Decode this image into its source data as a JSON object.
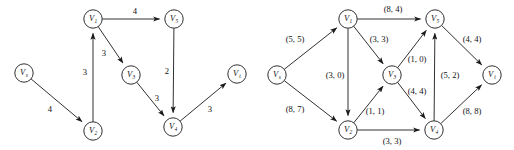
{
  "figure": {
    "background_color": "#ffffff",
    "ink_color": "#1a1a1a",
    "panel_count": 2
  },
  "chart_data": [
    {
      "type": "diagram",
      "subtype": "directed-weighted-graph",
      "name": "left-graph",
      "title": "",
      "edge_label_format": "weight",
      "nodes": [
        {
          "id": "vs",
          "label": "V",
          "subscript": "s",
          "x": 24,
          "y": 73
        },
        {
          "id": "v1",
          "label": "V",
          "subscript": "1",
          "x": 93,
          "y": 19
        },
        {
          "id": "v2",
          "label": "V",
          "subscript": "2",
          "x": 93,
          "y": 131
        },
        {
          "id": "v3",
          "label": "V",
          "subscript": "3",
          "x": 131,
          "y": 75
        },
        {
          "id": "v4",
          "label": "V",
          "subscript": "4",
          "x": 173,
          "y": 127
        },
        {
          "id": "v5",
          "label": "V",
          "subscript": "5",
          "x": 174,
          "y": 19
        },
        {
          "id": "vt",
          "label": "V",
          "subscript": "t",
          "x": 237,
          "y": 74
        }
      ],
      "edges": [
        {
          "from": "vs",
          "to": "v2",
          "label": "4",
          "label_x": 50,
          "label_y": 110
        },
        {
          "from": "v2",
          "to": "v1",
          "label": "3",
          "label_x": 85,
          "label_y": 73
        },
        {
          "from": "v1",
          "to": "v5",
          "label": "4",
          "label_x": 135,
          "label_y": 12
        },
        {
          "from": "v1",
          "to": "v3",
          "label": "3",
          "label_x": 104,
          "label_y": 54
        },
        {
          "from": "v3",
          "to": "v4",
          "label": "3",
          "label_x": 157,
          "label_y": 99
        },
        {
          "from": "v5",
          "to": "v4",
          "label": "2",
          "label_x": 167,
          "label_y": 72
        },
        {
          "from": "v4",
          "to": "vt",
          "label": "3",
          "label_x": 210,
          "label_y": 110
        }
      ]
    },
    {
      "type": "diagram",
      "subtype": "directed-flow-network",
      "name": "right-graph",
      "title": "",
      "edge_label_format": "(capacity, flow)",
      "nodes": [
        {
          "id": "vs",
          "label": "V",
          "subscript": "s",
          "x": 277,
          "y": 75
        },
        {
          "id": "v1",
          "label": "V",
          "subscript": "1",
          "x": 348,
          "y": 19
        },
        {
          "id": "v2",
          "label": "V",
          "subscript": "2",
          "x": 348,
          "y": 130
        },
        {
          "id": "v3",
          "label": "V",
          "subscript": "3",
          "x": 392,
          "y": 75
        },
        {
          "id": "v4",
          "label": "V",
          "subscript": "4",
          "x": 434,
          "y": 130
        },
        {
          "id": "v5",
          "label": "V",
          "subscript": "5",
          "x": 435,
          "y": 19
        },
        {
          "id": "vt",
          "label": "V",
          "subscript": "t",
          "x": 492,
          "y": 75
        }
      ],
      "edges": [
        {
          "from": "vs",
          "to": "v1",
          "capacity": 5,
          "flow": 5,
          "label": "(5, 5)",
          "label_x": 295,
          "label_y": 40
        },
        {
          "from": "vs",
          "to": "v2",
          "capacity": 8,
          "flow": 7,
          "label": "(8, 7)",
          "label_x": 295,
          "label_y": 110
        },
        {
          "from": "v1",
          "to": "v5",
          "capacity": 8,
          "flow": 4,
          "label": "(8, 4)",
          "label_x": 393,
          "label_y": 10
        },
        {
          "from": "v1",
          "to": "v3",
          "capacity": 3,
          "flow": 3,
          "label": "(3, 3)",
          "label_x": 379,
          "label_y": 40
        },
        {
          "from": "v1",
          "to": "v2",
          "capacity": 3,
          "flow": 0,
          "label": "(3, 0)",
          "label_x": 335,
          "label_y": 76
        },
        {
          "from": "v2",
          "to": "v3",
          "capacity": 1,
          "flow": 1,
          "label": "(1, 1)",
          "label_x": 375,
          "label_y": 112
        },
        {
          "from": "v2",
          "to": "v4",
          "capacity": 3,
          "flow": 3,
          "label": "(3, 3)",
          "label_x": 392,
          "label_y": 142
        },
        {
          "from": "v3",
          "to": "v5",
          "capacity": 1,
          "flow": 0,
          "label": "(1, 0)",
          "label_x": 417,
          "label_y": 60
        },
        {
          "from": "v3",
          "to": "v4",
          "capacity": 4,
          "flow": 4,
          "label": "(4, 4)",
          "label_x": 417,
          "label_y": 92
        },
        {
          "from": "v4",
          "to": "v5",
          "capacity": 5,
          "flow": 2,
          "label": "(5, 2)",
          "label_x": 450,
          "label_y": 76
        },
        {
          "from": "v5",
          "to": "vt",
          "capacity": 4,
          "flow": 4,
          "label": "(4, 4)",
          "label_x": 472,
          "label_y": 40
        },
        {
          "from": "v4",
          "to": "vt",
          "capacity": 8,
          "flow": 8,
          "label": "(8, 8)",
          "label_x": 472,
          "label_y": 112
        }
      ]
    }
  ]
}
